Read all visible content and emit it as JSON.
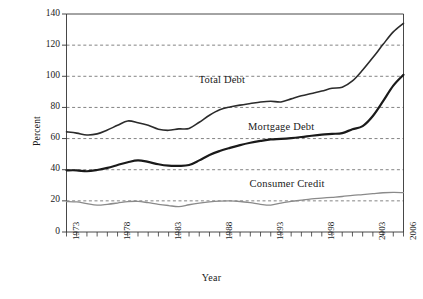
{
  "chart_data": {
    "type": "line",
    "title": "",
    "xlabel": "Year",
    "ylabel": "Percent",
    "xlim": [
      1973,
      2006
    ],
    "ylim": [
      0,
      140
    ],
    "ytick_values": [
      0,
      20,
      40,
      60,
      80,
      100,
      120,
      140
    ],
    "ytick_labels": [
      "0",
      "20",
      "40",
      "60",
      "80",
      "100",
      "120",
      "140"
    ],
    "xtick_labels": [
      "1973",
      "1978",
      "1983",
      "1988",
      "1993",
      "1998",
      "2003",
      "2006"
    ],
    "xtick_label_values": [
      1973,
      1978,
      1983,
      1988,
      1993,
      1998,
      2003,
      2006
    ],
    "xtick_minor_values": [
      1973,
      1974,
      1975,
      1976,
      1977,
      1978,
      1979,
      1980,
      1981,
      1982,
      1983,
      1984,
      1985,
      1986,
      1987,
      1988,
      1989,
      1990,
      1991,
      1992,
      1993,
      1994,
      1995,
      1996,
      1997,
      1998,
      1999,
      2000,
      2001,
      2002,
      2003,
      2004,
      2005,
      2006
    ],
    "grid": "horizontal-dashed",
    "legend_position": "inline-annotations",
    "x": [
      1973,
      1974,
      1975,
      1976,
      1977,
      1978,
      1979,
      1980,
      1981,
      1982,
      1983,
      1984,
      1985,
      1986,
      1987,
      1988,
      1989,
      1990,
      1991,
      1992,
      1993,
      1994,
      1995,
      1996,
      1997,
      1998,
      1999,
      2000,
      2001,
      2002,
      2003,
      2004,
      2005,
      2006
    ],
    "series": [
      {
        "name": "Total Debt",
        "color": "#2b2b2b",
        "width": 1.6,
        "label_x": 1988.2,
        "label_y": 97.0,
        "values": [
          64.3,
          63.5,
          62.3,
          63.0,
          65.5,
          68.5,
          71.3,
          70.2,
          68.5,
          66.0,
          65.3,
          66.2,
          66.5,
          70.5,
          75.0,
          78.5,
          80.3,
          81.5,
          82.5,
          83.5,
          84.0,
          83.5,
          85.5,
          87.5,
          89.0,
          90.5,
          92.3,
          93.0,
          97.0,
          104.0,
          112.0,
          120.5,
          128.5,
          134.0
        ]
      },
      {
        "name": "Mortgage Debt",
        "color": "#1a1a1a",
        "width": 2.2,
        "label_x": 1994.0,
        "label_y": 67.0,
        "values": [
          39.6,
          39.6,
          39.0,
          39.8,
          41.2,
          43.0,
          44.8,
          46.0,
          45.0,
          43.5,
          42.6,
          42.5,
          43.0,
          46.0,
          49.5,
          52.0,
          54.0,
          55.8,
          57.3,
          58.5,
          59.5,
          59.8,
          60.3,
          61.0,
          61.8,
          62.5,
          63.0,
          63.5,
          66.0,
          68.0,
          74.5,
          84.0,
          94.0,
          101.0
        ]
      },
      {
        "name": "Consumer Credit",
        "color": "#8a8a8a",
        "width": 1.3,
        "label_x": 1994.6,
        "label_y": 30.5,
        "values": [
          19.6,
          19.3,
          18.2,
          17.3,
          17.8,
          18.6,
          19.5,
          19.7,
          18.8,
          17.8,
          17.0,
          16.3,
          17.5,
          18.5,
          19.3,
          19.8,
          20.0,
          19.6,
          18.8,
          17.8,
          17.3,
          18.6,
          19.6,
          20.5,
          21.3,
          21.8,
          22.3,
          22.8,
          23.5,
          24.0,
          24.6,
          25.2,
          25.4,
          25.3
        ]
      }
    ]
  }
}
